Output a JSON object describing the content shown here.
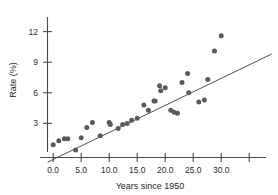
{
  "chart_data": {
    "type": "scatter",
    "title": "",
    "xlabel": "Years since 1950",
    "ylabel": "Rate (%)",
    "xlim": [
      -2,
      39
    ],
    "ylim": [
      -1.2,
      13.2
    ],
    "grid": false,
    "legend": null,
    "x_ticks": [
      0,
      5,
      10,
      15,
      20,
      25,
      30,
      35
    ],
    "x_tick_labels": [
      "0.0",
      "5.0",
      "10.0",
      "15.0",
      "20.0",
      "25.0",
      "30.0",
      ""
    ],
    "y_ticks": [
      3,
      6,
      9,
      12
    ],
    "y_tick_labels": [
      "3",
      "6",
      "9",
      "12"
    ],
    "point_color": "#5a5a5a",
    "line_color": "#4f4f4f",
    "axis_color": "#4a4a4a",
    "x": [
      0.0,
      1.0,
      2.0,
      2.6,
      4.0,
      5.0,
      6.0,
      7.0,
      8.4,
      10.0,
      10.2,
      11.6,
      12.4,
      13.2,
      14.0,
      15.0,
      16.2,
      17.0,
      18.0,
      18.2,
      19.0,
      19.2,
      20.0,
      21.0,
      21.6,
      22.2,
      23.0,
      24.0,
      24.2,
      26.0,
      27.0,
      27.6,
      28.8,
      30.0
    ],
    "y": [
      0.9,
      1.3,
      1.5,
      1.5,
      0.4,
      1.6,
      2.6,
      3.1,
      1.8,
      3.1,
      2.9,
      2.5,
      2.9,
      3.0,
      3.3,
      3.5,
      4.8,
      4.3,
      5.2,
      5.2,
      6.7,
      6.2,
      6.5,
      4.3,
      4.1,
      4.0,
      7.0,
      7.9,
      6.0,
      5.1,
      5.3,
      7.3,
      10.1,
      11.6
    ],
    "fit_line": {
      "x_start": -1.0,
      "y_start": -0.8,
      "x_end": 39.0,
      "y_end": 9.8
    }
  }
}
